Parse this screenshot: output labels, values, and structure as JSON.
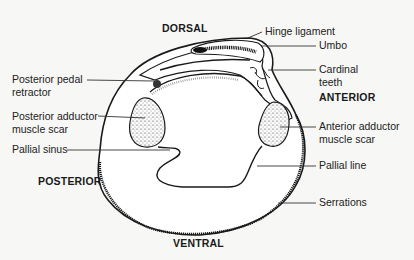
{
  "figure": {
    "directions": {
      "dorsal": "DORSAL",
      "ventral": "VENTRAL",
      "anterior": "ANTERIOR",
      "posterior": "POSTERIOR"
    },
    "labels_left": [
      {
        "id": "posterior-pedal-retractor",
        "lines": [
          "Posterior pedal",
          "retractor"
        ]
      },
      {
        "id": "posterior-adductor-muscle-scar",
        "lines": [
          "Posterior adductor",
          "muscle scar"
        ]
      },
      {
        "id": "pallial-sinus",
        "lines": [
          "Pallial sinus"
        ]
      }
    ],
    "labels_right": [
      {
        "id": "hinge-ligament",
        "lines": [
          "Hinge ligament"
        ]
      },
      {
        "id": "umbo",
        "lines": [
          "Umbo"
        ]
      },
      {
        "id": "cardinal-teeth",
        "lines": [
          "Cardinal",
          "teeth"
        ]
      },
      {
        "id": "anterior-adductor-muscle-scar",
        "lines": [
          "Anterior adductor",
          "muscle scar"
        ]
      },
      {
        "id": "pallial-line",
        "lines": [
          "Pallial line"
        ]
      },
      {
        "id": "serrations",
        "lines": [
          "Serrations"
        ]
      }
    ],
    "colors": {
      "ink": "#1a1a1a",
      "leader": "#333333",
      "background": "#f7f7f5"
    }
  }
}
